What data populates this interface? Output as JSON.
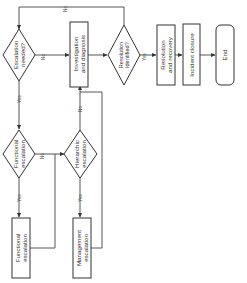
{
  "diagram": {
    "orientation": "rotated -90deg (text reads bottom-to-top)",
    "nodes": {
      "escalation_needed": {
        "type": "decision",
        "line1": "Escalation",
        "line2": "needed?"
      },
      "investigation": {
        "type": "process",
        "line1": "Investigation",
        "line2": "and diagnosis"
      },
      "resolution_identified": {
        "type": "decision",
        "line1": "Resolution",
        "line2": "identified?"
      },
      "resolution_recovery": {
        "type": "process",
        "line1": "Resolution",
        "line2": "and recovery"
      },
      "incident_closure": {
        "type": "process",
        "line1": "Incident closure"
      },
      "end": {
        "type": "terminal",
        "line1": "End"
      },
      "functional_escalation_q": {
        "type": "decision",
        "line1": "Functional",
        "line2": "escalation"
      },
      "hierarchic_escalation_q": {
        "type": "decision",
        "line1": "Hierarchic",
        "line2": "escalation"
      },
      "functional_escalation": {
        "type": "process",
        "line1": "Functional",
        "line2": "escalation"
      },
      "management_escalation": {
        "type": "process",
        "line1": "Management",
        "line2": "escalation"
      }
    },
    "edge_labels": {
      "escalation_no": "No",
      "escalation_yes": "Yes",
      "resolution_no": "No",
      "resolution_yes": "Yes",
      "functional_no": "No",
      "functional_yes": "Yes",
      "hierarchic_no": "No",
      "hierarchic_yes": "Yes"
    },
    "edges": [
      {
        "from": "escalation_needed",
        "to": "investigation",
        "label": "No"
      },
      {
        "from": "escalation_needed",
        "to": "functional_escalation_q",
        "label": "Yes"
      },
      {
        "from": "investigation",
        "to": "resolution_identified"
      },
      {
        "from": "resolution_identified",
        "to": "escalation_needed",
        "label": "No"
      },
      {
        "from": "resolution_identified",
        "to": "resolution_recovery",
        "label": "Yes"
      },
      {
        "from": "resolution_recovery",
        "to": "incident_closure"
      },
      {
        "from": "incident_closure",
        "to": "end"
      },
      {
        "from": "functional_escalation_q",
        "to": "hierarchic_escalation_q",
        "label": "No"
      },
      {
        "from": "functional_escalation_q",
        "to": "functional_escalation",
        "label": "Yes"
      },
      {
        "from": "functional_escalation",
        "to": "hierarchic_escalation_q"
      },
      {
        "from": "hierarchic_escalation_q",
        "to": "investigation",
        "label": "No"
      },
      {
        "from": "hierarchic_escalation_q",
        "to": "management_escalation",
        "label": "Yes"
      },
      {
        "from": "management_escalation",
        "to": "investigation"
      }
    ]
  }
}
